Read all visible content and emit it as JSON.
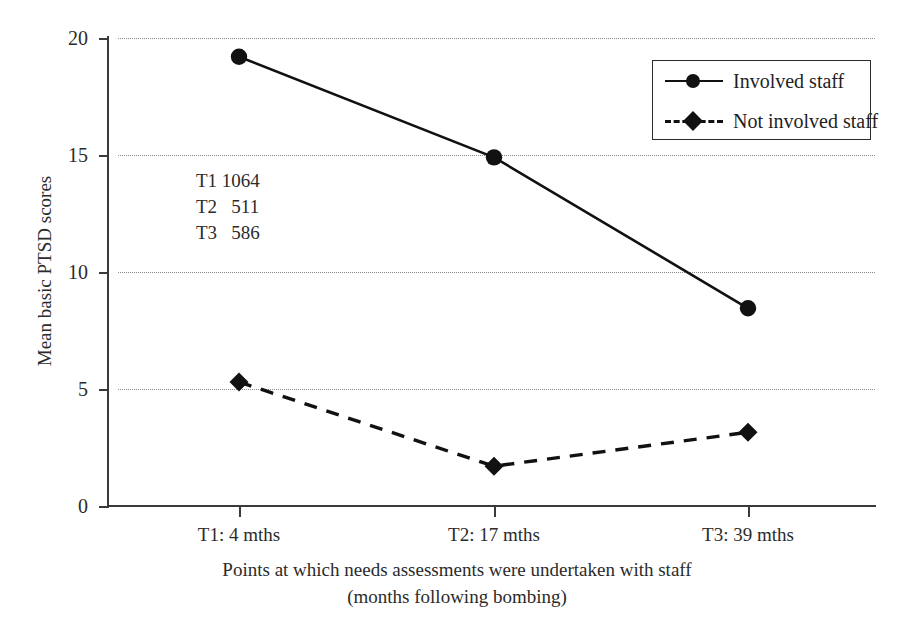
{
  "chart_data": {
    "type": "line",
    "title": "",
    "xlabel": "Points at which needs assessments were undertaken with staff (months following bombing)",
    "xlabel_line1": "Points at which needs assessments were undertaken with staff",
    "xlabel_line2": "(months following bombing)",
    "ylabel": "Mean basic PTSD scores",
    "categories": [
      "T1: 4 mths",
      "T2: 17 mths",
      "T3: 39 mths"
    ],
    "series": [
      {
        "name": "Involved staff",
        "values": [
          19.2,
          14.9,
          8.45
        ],
        "marker": "circle",
        "linestyle": "solid"
      },
      {
        "name": "Not involved staff",
        "values": [
          5.3,
          1.7,
          3.15
        ],
        "marker": "diamond",
        "linestyle": "dashed"
      }
    ],
    "ylim": [
      0,
      20
    ],
    "yticks": [
      0,
      5,
      10,
      15,
      20
    ],
    "ytick_labels": [
      "0",
      "5",
      "10",
      "15",
      "20"
    ],
    "grid": "horizontal-dotted",
    "legend_position": "top-right",
    "annotations": [
      {
        "label": "T1",
        "value": "1064"
      },
      {
        "label": "T2",
        "value": "511"
      },
      {
        "label": "T3",
        "value": "586"
      }
    ],
    "colors": {
      "line": "#111111",
      "axis": "#3a3a3a",
      "grid": "#8a8a8a",
      "text": "#2b2b2b"
    }
  }
}
